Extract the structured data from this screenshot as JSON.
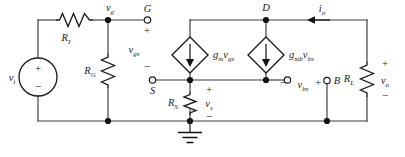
{
  "figure": {
    "background_color": "#ffffff",
    "line_color": "#2b2b2b",
    "text_color": "#1a1a1a"
  },
  "sources": {
    "input": {
      "name": "independent-voltage-source",
      "label_main": "v",
      "label_sub": "i",
      "plus": "+",
      "minus": "−"
    },
    "gm_source": {
      "name": "dependent-current-source-gm",
      "label_main": "g",
      "label_sub1": "m",
      "label_var": "v",
      "label_sub2": "gs",
      "arrow_direction": "down"
    },
    "gmb_source": {
      "name": "dependent-current-source-gmb",
      "label_main": "g",
      "label_sub1": "mb",
      "label_var": "v",
      "label_sub2": "bs",
      "arrow_direction": "down"
    }
  },
  "resistors": {
    "ri": {
      "label_main": "R",
      "label_sub": "I",
      "orientation": "horizontal"
    },
    "rg": {
      "label_main": "R",
      "label_sub": "G",
      "orientation": "vertical"
    },
    "rs": {
      "label_main": "R",
      "label_sub": "S",
      "orientation": "vertical"
    },
    "rl": {
      "label_main": "R",
      "label_sub": "L",
      "orientation": "vertical"
    }
  },
  "terminals": {
    "gate": {
      "label": "G",
      "type": "open-circle"
    },
    "source": {
      "label": "S",
      "type": "open-circle"
    },
    "drain": {
      "label": "D",
      "type": "node-dot"
    },
    "body": {
      "label": "B",
      "type": "open-circle"
    },
    "bulk_return": {
      "label": "",
      "type": "open-circle"
    }
  },
  "node_labels": {
    "vg": {
      "main": "v",
      "sub": "g"
    }
  },
  "voltages": {
    "vgs": {
      "main": "v",
      "sub": "gs",
      "plus": "+",
      "minus": "−"
    },
    "vs": {
      "main": "v",
      "sub": "s",
      "plus": "+",
      "minus": "−"
    },
    "vbs": {
      "main": "v",
      "sub": "bs",
      "plus": "+",
      "minus": "−"
    },
    "vo": {
      "main": "v",
      "sub": "o",
      "plus": "+",
      "minus": "−"
    }
  },
  "currents": {
    "io": {
      "main": "i",
      "sub": "o",
      "direction": "left"
    }
  },
  "ground": {
    "name": "ground-symbol",
    "bars": 3
  }
}
